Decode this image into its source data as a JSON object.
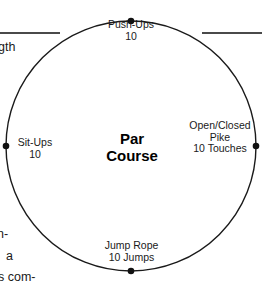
{
  "diagram": {
    "type": "circular-station-course",
    "title": "Par Course",
    "center_label": {
      "line1": "Par",
      "line2": "Course"
    },
    "circle": {
      "center_x": 131,
      "center_y": 146,
      "radius": 125,
      "stroke_color": "#1a1a1a",
      "fill_color": "#ffffff",
      "node_dot_color": "#111111"
    },
    "stations": [
      {
        "position": "top",
        "name": "Push-Ups",
        "reps": "10",
        "lines": [
          "Push-Ups",
          "10"
        ]
      },
      {
        "position": "left",
        "name": "Sit-Ups",
        "reps": "10",
        "lines": [
          "Sit-Ups",
          "10"
        ]
      },
      {
        "position": "right",
        "name": "Open/Closed Pike",
        "reps": "10 Touches",
        "lines": [
          "Open/Closed",
          "Pike",
          "10 Touches"
        ]
      },
      {
        "position": "bottom",
        "name": "Jump Rope",
        "reps": "10 Jumps",
        "lines": [
          "Jump Rope",
          "10 Jumps"
        ]
      }
    ]
  },
  "page_fragments": {
    "rule_color": "#4a4a4a",
    "top_left_text": "gth",
    "bottom_left_1": "n-",
    "bottom_left_2": "a",
    "bottom_left_3": "s com-"
  }
}
